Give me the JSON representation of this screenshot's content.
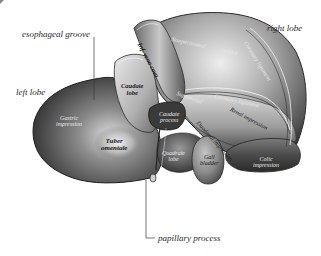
{
  "figure": {
    "colors": {
      "background": "#ffffff",
      "label_text": "#2a2a2a",
      "leader_line": "#3a3a3a",
      "organ_dark": "#3c3c3c",
      "organ_mid": "#8a8a8a",
      "organ_light": "#e6e6e6"
    }
  },
  "callouts": {
    "esophageal_groove": "esophageal groove",
    "right_lobe": "right lobe",
    "left_lobe": "left lobe",
    "papillary_process": "papillary process"
  },
  "inner_labels": {
    "inf_vena_cava": "Inf. vena cava",
    "caudate_lobe_line1": "Caudate",
    "caudate_lobe_line2": "lobe",
    "nonperitoneal_line1": "Nonperitoneal",
    "nonperitoneal_line2": "surface",
    "coronary_ligament_upper": "Coronary ligament",
    "coronary_ligament_lower": "Coronary ligament",
    "suprarenal_line1": "Suprarenal",
    "suprarenal_line2": "impress.",
    "caudate_process_line1": "Caudate",
    "caudate_process_line2": "process",
    "renal_impression": "Renal impression",
    "duodenal_impression": "Duodenal impression",
    "gastric_line1": "Gastric",
    "gastric_line2": "impression",
    "tuber_line1": "Tuber",
    "tuber_line2": "omentale",
    "quadrate_line1": "Quadrate",
    "quadrate_line2": "lobe",
    "gall_line1": "Gall",
    "gall_line2": "bladder",
    "colic_line1": "Colic",
    "colic_line2": "impression"
  }
}
